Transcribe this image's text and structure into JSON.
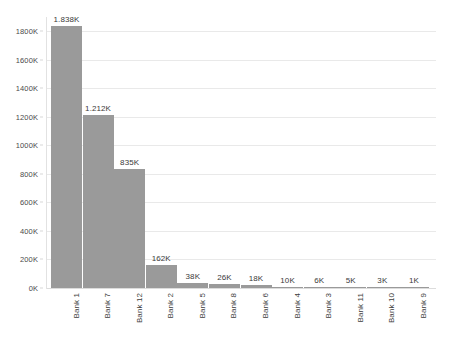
{
  "chart_data": {
    "type": "bar",
    "title": "",
    "xlabel": "",
    "ylabel": "",
    "categories": [
      "Bank 1",
      "Bank 7",
      "Bank 12",
      "Bank 2",
      "Bank 5",
      "Bank 8",
      "Bank 6",
      "Bank 4",
      "Bank 3",
      "Bank 11",
      "Bank 10",
      "Bank 9"
    ],
    "values": [
      1838000,
      1212000,
      835000,
      162000,
      38000,
      26000,
      18000,
      10000,
      6000,
      5000,
      3000,
      1000
    ],
    "data_labels": [
      "1.838K",
      "1.212K",
      "835K",
      "162K",
      "38K",
      "26K",
      "18K",
      "10K",
      "6K",
      "5K",
      "3K",
      "1K"
    ],
    "ylim": [
      0,
      1900000
    ],
    "y_ticks": [
      0,
      200000,
      400000,
      600000,
      800000,
      1000000,
      1200000,
      1400000,
      1600000,
      1800000
    ],
    "y_tick_labels": [
      "0K",
      "200K",
      "400K",
      "600K",
      "800K",
      "1000K",
      "1200K",
      "1400K",
      "1600K",
      "1800K"
    ],
    "grid": true,
    "legend": "none",
    "bar_color": "#9a9a9a",
    "gridline_color": "#e9e9e9",
    "background_color": "#ffffff"
  }
}
